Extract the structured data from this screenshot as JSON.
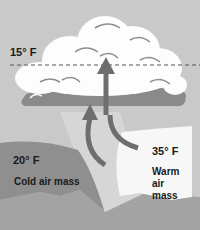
{
  "diagram": {
    "top_temperature": "15° F",
    "cold_temperature": "20° F",
    "warm_temperature": "35° F",
    "cold_label": "Cold air mass",
    "warm_label_lines": [
      "Warm",
      "air",
      "mass"
    ]
  },
  "colors": {
    "sky": "#c9c9c9",
    "cloud_white": "#fdfdfd",
    "cloud_shadow": "#8d8d8d",
    "cloud_base": "#8a8a8a",
    "cold_mass": "#8f8f8f",
    "warm_mass": "#f7f7f7",
    "ground": "#a3a3a3",
    "rising_column": "#d6d6d6",
    "arrow": "#6e6e6e"
  }
}
